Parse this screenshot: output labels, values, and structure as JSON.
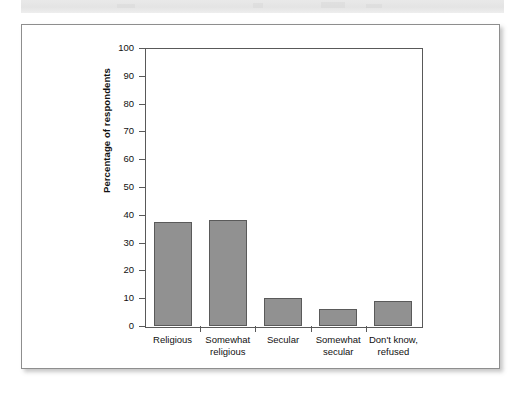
{
  "page": {
    "background_color": "#ffffff",
    "panel_background": "#ffffff",
    "panel_border_color": "#8e8e8e",
    "banner_color": "#e7e7e7"
  },
  "chart_data": {
    "type": "bar",
    "title": "",
    "subtitle": "",
    "xlabel": "",
    "ylabel": "Percentage of respondents",
    "categories": [
      "Religious",
      "Somewhat\nreligious",
      "Secular",
      "Somewhat\nsecular",
      "Don't know,\nrefused"
    ],
    "values": [
      37.4,
      38.2,
      10.1,
      6.1,
      9.0
    ],
    "ylim": [
      0,
      100
    ],
    "yticks": [
      0,
      10,
      20,
      30,
      40,
      50,
      60,
      70,
      80,
      90,
      100
    ],
    "ytick_labels": [
      "0",
      "10",
      "20",
      "30",
      "40",
      "50",
      "60",
      "70",
      "80",
      "90",
      "100"
    ],
    "grid": false,
    "legend": null,
    "bar_color": "#919191",
    "bar_edge_color": "#5a5a5a",
    "axis_color": "#595959"
  }
}
